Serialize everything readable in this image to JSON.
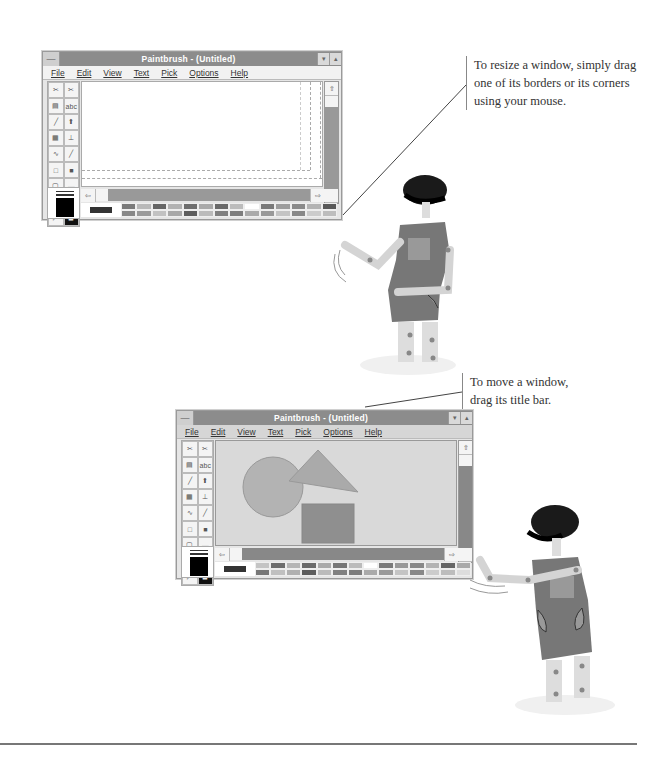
{
  "top_window": {
    "title": "Paintbrush - (Untitled)",
    "menu": [
      "File",
      "Edit",
      "View",
      "Text",
      "Pick",
      "Options",
      "Help"
    ],
    "system_menu_icon": "minus",
    "minimize_icon": "▾",
    "maximize_icon": "▴",
    "tools": [
      "✂",
      "✂",
      "▤",
      "abc",
      "╱",
      "⬆",
      "▦",
      "⊥",
      "∿",
      "╱",
      "□",
      "■",
      "▢",
      "▬",
      "○",
      "●",
      "◸",
      "◼"
    ],
    "scroll_up": "⇧",
    "scroll_down": "⇩",
    "scroll_left": "⇦",
    "scroll_right": "⇨"
  },
  "bottom_window": {
    "title": "Paintbrush - (Untitled)",
    "menu": [
      "File",
      "Edit",
      "View",
      "Text",
      "Pick",
      "Options",
      "Help"
    ],
    "system_menu_icon": "minus",
    "minimize_icon": "▾",
    "maximize_icon": "▴",
    "tools": [
      "✂",
      "✂",
      "▤",
      "abc",
      "╱",
      "⬆",
      "▦",
      "⊥",
      "∿",
      "╱",
      "□",
      "■",
      "▢",
      "▬",
      "○",
      "●",
      "◸",
      "◼"
    ],
    "scroll_up": "⇧",
    "scroll_down": "⇩",
    "scroll_left": "⇦",
    "scroll_right": "⇨",
    "shapes": [
      "circle",
      "triangle",
      "square"
    ]
  },
  "captions": {
    "resize": "To resize a window, simply drag one of its borders or its corners using your mouse.",
    "move": "To move a window, drag its title bar."
  },
  "palette_colors": [
    "#777",
    "#b5b5b5",
    "#6a6a6a",
    "#b0b0b0",
    "#6f6f6f",
    "#a8a8a8",
    "#666",
    "#bdbdbd",
    "#fff",
    "#7a7a7a",
    "#999",
    "#888",
    "#b3b3b3",
    "#555",
    "#8a8a8a",
    "#999",
    "#c0c0c0",
    "#aaa",
    "#5e5e5e",
    "#bbb",
    "#808080",
    "#7d7d7d",
    "#aaa",
    "#999",
    "#c4c4c4",
    "#888",
    "#ccc",
    "#bdbdbd"
  ]
}
